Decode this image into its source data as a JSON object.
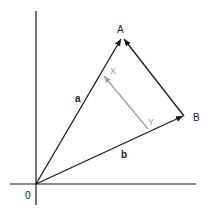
{
  "diagram": {
    "labels": {
      "origin": "0",
      "point_a": "A",
      "point_b": "B",
      "vector_a": "a",
      "vector_b": "b",
      "point_x": "X",
      "point_y": "Y"
    },
    "colors": {
      "main": "#1a1a1a",
      "secondary": "#a0a0a0"
    },
    "vectors": [
      {
        "name": "a",
        "from": "O",
        "to": "A"
      },
      {
        "name": "b",
        "from": "O",
        "to": "B"
      },
      {
        "name": "BA",
        "from": "B",
        "to": "A"
      },
      {
        "name": "YX",
        "from": "Y",
        "to": "X"
      }
    ]
  }
}
